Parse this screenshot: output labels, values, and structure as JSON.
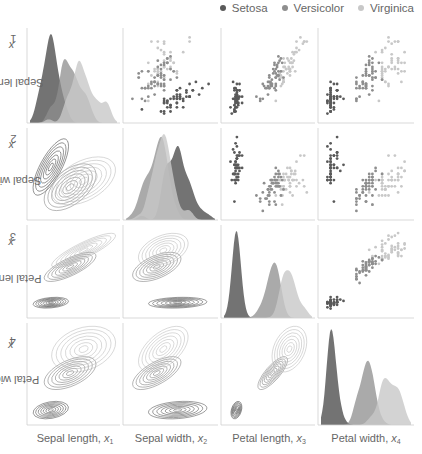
{
  "legend": {
    "items": [
      {
        "label": "Setosa",
        "color": "#5a5a5a"
      },
      {
        "label": "Versicolor",
        "color": "#8e8e8e"
      },
      {
        "label": "Virginica",
        "color": "#c8c8c8"
      }
    ]
  },
  "axes": {
    "x_labels": [
      {
        "name": "Sepal length,",
        "var": "x",
        "sub": "1"
      },
      {
        "name": "Sepal width,",
        "var": "x",
        "sub": "2"
      },
      {
        "name": "Petal length,",
        "var": "x",
        "sub": "3"
      },
      {
        "name": "Petal width,",
        "var": "x",
        "sub": "4"
      }
    ],
    "y_labels": [
      {
        "name": "Sepal length,",
        "var": "x",
        "sub": "1"
      },
      {
        "name": "Sepal width,",
        "var": "x",
        "sub": "2"
      },
      {
        "name": "Petal length,",
        "var": "x",
        "sub": "3"
      },
      {
        "name": "Petal width,",
        "var": "x",
        "sub": "4"
      }
    ]
  },
  "chart_data": {
    "type": "scatter",
    "title": "",
    "layout": "pairplot 4x4: diagonal=KDE, upper=scatter, lower=KDE contour",
    "variables": [
      "Sepal length",
      "Sepal width",
      "Petal length",
      "Petal width"
    ],
    "ranges": [
      [
        4.0,
        8.2
      ],
      [
        1.8,
        4.6
      ],
      [
        0.5,
        7.3
      ],
      [
        -0.1,
        2.7
      ]
    ],
    "grid": false,
    "legend_position": "top-right",
    "series": [
      {
        "name": "Setosa",
        "color": "#5a5a5a",
        "points": [
          [
            5.1,
            3.5,
            1.4,
            0.2
          ],
          [
            4.9,
            3.0,
            1.4,
            0.2
          ],
          [
            4.7,
            3.2,
            1.3,
            0.2
          ],
          [
            4.6,
            3.1,
            1.5,
            0.2
          ],
          [
            5.0,
            3.6,
            1.4,
            0.2
          ],
          [
            5.4,
            3.9,
            1.7,
            0.4
          ],
          [
            4.6,
            3.4,
            1.4,
            0.3
          ],
          [
            5.0,
            3.4,
            1.5,
            0.2
          ],
          [
            4.4,
            2.9,
            1.4,
            0.2
          ],
          [
            4.9,
            3.1,
            1.5,
            0.1
          ],
          [
            5.4,
            3.7,
            1.5,
            0.2
          ],
          [
            4.8,
            3.4,
            1.6,
            0.2
          ],
          [
            4.8,
            3.0,
            1.4,
            0.1
          ],
          [
            4.3,
            3.0,
            1.1,
            0.1
          ],
          [
            5.8,
            4.0,
            1.2,
            0.2
          ],
          [
            5.7,
            4.4,
            1.5,
            0.4
          ],
          [
            5.4,
            3.9,
            1.3,
            0.4
          ],
          [
            5.1,
            3.5,
            1.4,
            0.3
          ],
          [
            5.7,
            3.8,
            1.7,
            0.3
          ],
          [
            5.1,
            3.8,
            1.5,
            0.3
          ],
          [
            5.4,
            3.4,
            1.7,
            0.2
          ],
          [
            5.1,
            3.7,
            1.5,
            0.4
          ],
          [
            4.6,
            3.6,
            1.0,
            0.2
          ],
          [
            5.1,
            3.3,
            1.7,
            0.5
          ],
          [
            4.8,
            3.4,
            1.9,
            0.2
          ],
          [
            5.0,
            3.0,
            1.6,
            0.2
          ],
          [
            5.0,
            3.4,
            1.6,
            0.4
          ],
          [
            5.2,
            3.5,
            1.5,
            0.2
          ],
          [
            5.2,
            3.4,
            1.4,
            0.2
          ],
          [
            4.7,
            3.2,
            1.6,
            0.2
          ],
          [
            4.8,
            3.1,
            1.6,
            0.2
          ],
          [
            5.4,
            3.4,
            1.5,
            0.4
          ],
          [
            5.2,
            4.1,
            1.5,
            0.1
          ],
          [
            5.5,
            4.2,
            1.4,
            0.2
          ],
          [
            4.9,
            3.1,
            1.5,
            0.2
          ],
          [
            5.0,
            3.2,
            1.2,
            0.2
          ],
          [
            5.5,
            3.5,
            1.3,
            0.2
          ],
          [
            4.9,
            3.6,
            1.4,
            0.1
          ],
          [
            4.4,
            3.0,
            1.3,
            0.2
          ],
          [
            5.1,
            3.4,
            1.5,
            0.2
          ],
          [
            5.0,
            3.5,
            1.3,
            0.3
          ],
          [
            4.5,
            2.3,
            1.3,
            0.3
          ],
          [
            4.4,
            3.2,
            1.3,
            0.2
          ],
          [
            5.0,
            3.5,
            1.6,
            0.6
          ],
          [
            5.1,
            3.8,
            1.9,
            0.4
          ],
          [
            4.8,
            3.0,
            1.4,
            0.3
          ],
          [
            5.1,
            3.8,
            1.6,
            0.2
          ],
          [
            4.6,
            3.2,
            1.4,
            0.2
          ],
          [
            5.3,
            3.7,
            1.5,
            0.2
          ],
          [
            5.0,
            3.3,
            1.4,
            0.2
          ]
        ]
      },
      {
        "name": "Versicolor",
        "color": "#8e8e8e",
        "points": [
          [
            7.0,
            3.2,
            4.7,
            1.4
          ],
          [
            6.4,
            3.2,
            4.5,
            1.5
          ],
          [
            6.9,
            3.1,
            4.9,
            1.5
          ],
          [
            5.5,
            2.3,
            4.0,
            1.3
          ],
          [
            6.5,
            2.8,
            4.6,
            1.5
          ],
          [
            5.7,
            2.8,
            4.5,
            1.3
          ],
          [
            6.3,
            3.3,
            4.7,
            1.6
          ],
          [
            4.9,
            2.4,
            3.3,
            1.0
          ],
          [
            6.6,
            2.9,
            4.6,
            1.3
          ],
          [
            5.2,
            2.7,
            3.9,
            1.4
          ],
          [
            5.0,
            2.0,
            3.5,
            1.0
          ],
          [
            5.9,
            3.0,
            4.2,
            1.5
          ],
          [
            6.0,
            2.2,
            4.0,
            1.0
          ],
          [
            6.1,
            2.9,
            4.7,
            1.4
          ],
          [
            5.6,
            2.9,
            3.6,
            1.3
          ],
          [
            6.7,
            3.1,
            4.4,
            1.4
          ],
          [
            5.6,
            3.0,
            4.5,
            1.5
          ],
          [
            5.8,
            2.7,
            4.1,
            1.0
          ],
          [
            6.2,
            2.2,
            4.5,
            1.5
          ],
          [
            5.6,
            2.5,
            3.9,
            1.1
          ],
          [
            5.9,
            3.2,
            4.8,
            1.8
          ],
          [
            6.1,
            2.8,
            4.0,
            1.3
          ],
          [
            6.3,
            2.5,
            4.9,
            1.5
          ],
          [
            6.1,
            2.8,
            4.7,
            1.2
          ],
          [
            6.4,
            2.9,
            4.3,
            1.3
          ],
          [
            6.6,
            3.0,
            4.4,
            1.4
          ],
          [
            6.8,
            2.8,
            4.8,
            1.4
          ],
          [
            6.7,
            3.0,
            5.0,
            1.7
          ],
          [
            6.0,
            2.9,
            4.5,
            1.5
          ],
          [
            5.7,
            2.6,
            3.5,
            1.0
          ],
          [
            5.5,
            2.4,
            3.8,
            1.1
          ],
          [
            5.5,
            2.4,
            3.7,
            1.0
          ],
          [
            5.8,
            2.7,
            3.9,
            1.2
          ],
          [
            6.0,
            2.7,
            5.1,
            1.6
          ],
          [
            5.4,
            3.0,
            4.5,
            1.5
          ],
          [
            6.0,
            3.4,
            4.5,
            1.6
          ],
          [
            6.7,
            3.1,
            4.7,
            1.5
          ],
          [
            6.3,
            2.3,
            4.4,
            1.3
          ],
          [
            5.6,
            3.0,
            4.1,
            1.3
          ],
          [
            5.5,
            2.5,
            4.0,
            1.3
          ],
          [
            5.5,
            2.6,
            4.4,
            1.2
          ],
          [
            6.1,
            3.0,
            4.6,
            1.4
          ],
          [
            5.8,
            2.6,
            4.0,
            1.2
          ],
          [
            5.0,
            2.3,
            3.3,
            1.0
          ],
          [
            5.6,
            2.7,
            4.2,
            1.3
          ],
          [
            5.7,
            3.0,
            4.2,
            1.2
          ],
          [
            5.7,
            2.9,
            4.2,
            1.3
          ],
          [
            6.2,
            2.9,
            4.3,
            1.3
          ],
          [
            5.1,
            2.5,
            3.0,
            1.1
          ],
          [
            5.7,
            2.8,
            4.1,
            1.3
          ]
        ]
      },
      {
        "name": "Virginica",
        "color": "#c8c8c8",
        "points": [
          [
            6.3,
            3.3,
            6.0,
            2.5
          ],
          [
            5.8,
            2.7,
            5.1,
            1.9
          ],
          [
            7.1,
            3.0,
            5.9,
            2.1
          ],
          [
            6.3,
            2.9,
            5.6,
            1.8
          ],
          [
            6.5,
            3.0,
            5.8,
            2.2
          ],
          [
            7.6,
            3.0,
            6.6,
            2.1
          ],
          [
            4.9,
            2.5,
            4.5,
            1.7
          ],
          [
            7.3,
            2.9,
            6.3,
            1.8
          ],
          [
            6.7,
            2.5,
            5.8,
            1.8
          ],
          [
            7.2,
            3.6,
            6.1,
            2.5
          ],
          [
            6.5,
            3.2,
            5.1,
            2.0
          ],
          [
            6.4,
            2.7,
            5.3,
            1.9
          ],
          [
            6.8,
            3.0,
            5.5,
            2.1
          ],
          [
            5.7,
            2.5,
            5.0,
            2.0
          ],
          [
            5.8,
            2.8,
            5.1,
            2.4
          ],
          [
            6.4,
            3.2,
            5.3,
            2.3
          ],
          [
            6.5,
            3.0,
            5.5,
            1.8
          ],
          [
            7.7,
            3.8,
            6.7,
            2.2
          ],
          [
            7.7,
            2.6,
            6.9,
            2.3
          ],
          [
            6.0,
            2.2,
            5.0,
            1.5
          ],
          [
            6.9,
            3.2,
            5.7,
            2.3
          ],
          [
            5.6,
            2.8,
            4.9,
            2.0
          ],
          [
            7.7,
            2.8,
            6.7,
            2.0
          ],
          [
            6.3,
            2.7,
            4.9,
            1.8
          ],
          [
            6.7,
            3.3,
            5.7,
            2.1
          ],
          [
            7.2,
            3.2,
            6.0,
            1.8
          ],
          [
            6.2,
            2.8,
            4.8,
            1.8
          ],
          [
            6.1,
            3.0,
            4.9,
            1.8
          ],
          [
            6.4,
            2.8,
            5.6,
            2.1
          ],
          [
            7.2,
            3.0,
            5.8,
            1.6
          ],
          [
            7.4,
            2.8,
            6.1,
            1.9
          ],
          [
            7.9,
            3.8,
            6.4,
            2.0
          ],
          [
            6.4,
            2.8,
            5.6,
            2.2
          ],
          [
            6.3,
            2.8,
            5.1,
            1.5
          ],
          [
            6.1,
            2.6,
            5.6,
            1.4
          ],
          [
            7.7,
            3.0,
            6.1,
            2.3
          ],
          [
            6.3,
            3.4,
            5.6,
            2.4
          ],
          [
            6.4,
            3.1,
            5.5,
            1.8
          ],
          [
            6.0,
            3.0,
            4.8,
            1.8
          ],
          [
            6.9,
            3.1,
            5.4,
            2.1
          ],
          [
            6.7,
            3.1,
            5.6,
            2.4
          ],
          [
            6.9,
            3.1,
            5.1,
            2.3
          ],
          [
            5.8,
            2.7,
            5.1,
            1.9
          ],
          [
            6.8,
            3.2,
            5.9,
            2.3
          ],
          [
            6.7,
            3.3,
            5.7,
            2.5
          ],
          [
            6.7,
            3.0,
            5.2,
            2.3
          ],
          [
            6.3,
            2.5,
            5.0,
            1.9
          ],
          [
            6.5,
            3.0,
            5.2,
            2.0
          ],
          [
            6.2,
            3.4,
            5.4,
            2.3
          ],
          [
            5.9,
            3.0,
            5.1,
            1.8
          ]
        ]
      }
    ]
  }
}
